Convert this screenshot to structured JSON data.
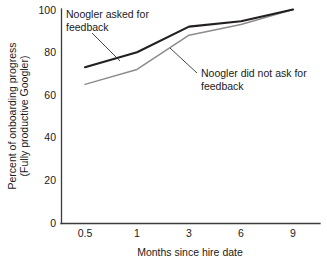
{
  "chart_data": {
    "type": "line",
    "title": "",
    "xlabel": "Months since hire date",
    "ylabel": "Percent of onboarding progress\n(Fully productive Googler)",
    "ylabel_line1": "Percent of onboarding progress",
    "ylabel_line2": "(Fully productive Googler)",
    "categories": [
      "0.5",
      "1",
      "3",
      "6",
      "9"
    ],
    "x_tick_labels": [
      "0.5",
      "1",
      "3",
      "6",
      "9"
    ],
    "y_tick_labels": [
      "0",
      "20",
      "40",
      "60",
      "80",
      "100"
    ],
    "y_tick_values": [
      0,
      20,
      40,
      60,
      80,
      100
    ],
    "ylim": [
      0,
      100
    ],
    "grid": false,
    "legend": "none",
    "series": [
      {
        "name": "Noogler asked for feedback",
        "color": "#231f20",
        "width": 2.1,
        "values": [
          73,
          80,
          92,
          94.5,
          100
        ]
      },
      {
        "name": "Noogler did not ask for feedback",
        "color": "#8c8c8c",
        "width": 1.5,
        "values": [
          65,
          72,
          88,
          93,
          100
        ]
      }
    ],
    "annotations": [
      {
        "id": "annotation-asked",
        "line1": "Noogler asked for",
        "line2": "feedback",
        "target_series": "Noogler asked for feedback"
      },
      {
        "id": "annotation-not-asked",
        "line1": "Noogler did not ask for",
        "line2": "feedback",
        "target_series": "Noogler did not ask for feedback"
      }
    ]
  }
}
